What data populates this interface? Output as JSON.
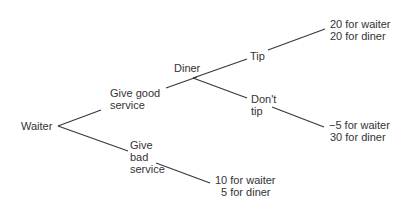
{
  "tree": {
    "root": "Waiter",
    "waiter_moves": {
      "good": "Give good service",
      "good_line1": "Give good",
      "good_line2": "service",
      "bad_line1": "Give",
      "bad_line2": "bad",
      "bad_line3": "service"
    },
    "diner": "Diner",
    "diner_moves": {
      "tip": "Tip",
      "dont_tip_line1": "Don't",
      "dont_tip_line2": "tip"
    },
    "payoffs": {
      "tip": {
        "waiter": "20 for waiter",
        "diner": "20 for diner"
      },
      "dont_tip": {
        "waiter": "−5 for waiter",
        "diner": "30 for diner"
      },
      "bad": {
        "waiter": "10 for waiter",
        "diner": "5 for diner"
      }
    },
    "line_color": "#3a3a3a"
  }
}
